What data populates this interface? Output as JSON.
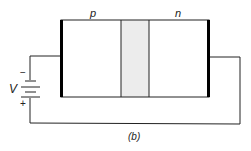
{
  "diagram": {
    "caption": "(b)",
    "regions": [
      {
        "label": "p"
      },
      {
        "label": "n"
      }
    ],
    "battery": {
      "label": "V",
      "negative_sign": "−",
      "positive_sign": "+"
    },
    "colors": {
      "wire": "#222222",
      "depletion_fill": "#ececec",
      "contact": "#000000"
    }
  }
}
